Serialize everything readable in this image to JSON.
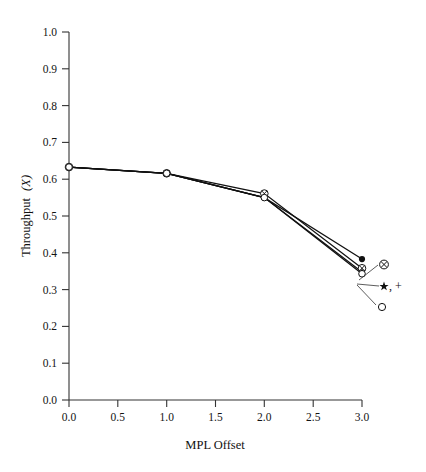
{
  "chart_data": {
    "type": "line",
    "title": "",
    "xlabel": "MPL Offset",
    "ylabel": "Throughput (X)",
    "ylabel_plain": "Throughput",
    "ylabel_symbol": "(X)",
    "xlim": [
      0.0,
      3.0
    ],
    "ylim": [
      0.0,
      1.0
    ],
    "grid": false,
    "legend_position": "right-inline-leader-lines",
    "x": [
      0.0,
      1.0,
      2.0,
      3.0
    ],
    "xticks": [
      "0.0",
      "0.5",
      "1.0",
      "1.5",
      "2.0",
      "2.5",
      "3.0"
    ],
    "xtick_values": [
      0.0,
      0.5,
      1.0,
      1.5,
      2.0,
      2.5,
      3.0
    ],
    "yticks": [
      "0.0",
      "0.1",
      "0.2",
      "0.3",
      "0.4",
      "0.5",
      "0.6",
      "0.7",
      "0.8",
      "0.9",
      "1.0"
    ],
    "ytick_values": [
      0.0,
      0.1,
      0.2,
      0.3,
      0.4,
      0.5,
      0.6,
      0.7,
      0.8,
      0.9,
      1.0
    ],
    "series": [
      {
        "name": "plus",
        "marker": "+",
        "legend_label": "+",
        "values": [
          0.633,
          0.616,
          0.55,
          0.383
        ]
      },
      {
        "name": "circled-cross",
        "marker": "⊗",
        "legend_label": "⊗",
        "values": [
          0.633,
          0.616,
          0.561,
          0.358
        ]
      },
      {
        "name": "star",
        "marker": "★",
        "legend_label": "★,",
        "values": [
          0.633,
          0.616,
          0.55,
          0.348
        ]
      },
      {
        "name": "open-circle",
        "marker": "○",
        "legend_label": "○",
        "values": [
          0.633,
          0.616,
          0.55,
          0.343
        ]
      }
    ],
    "legend_entries": [
      {
        "symbol": "⊗",
        "label": ""
      },
      {
        "symbol": "★",
        "label": ",  +"
      },
      {
        "symbol": "○",
        "label": ""
      }
    ],
    "colors": {
      "line": "#111111",
      "axis": "#333333",
      "background": "#ffffff",
      "text": "#141414"
    }
  }
}
